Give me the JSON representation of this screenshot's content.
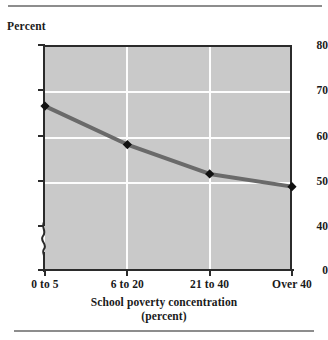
{
  "figure": {
    "y_axis_title": "Percent",
    "x_axis_title_line1": "School poverty concentration",
    "x_axis_title_line2": "(percent)"
  },
  "style": {
    "plot_fill": "#c9c9c9",
    "gridline_color": "#fdfdfd",
    "axis_color": "#2b2b2b",
    "line_color": "#6a6a6a",
    "marker_color": "#111111",
    "rule_color": "#8d8d8d"
  },
  "chart_data": {
    "type": "line",
    "title": "",
    "xlabel": "School poverty concentration (percent)",
    "ylabel": "Percent",
    "categories": [
      "0 to 5",
      "6 to 20",
      "21 to 40",
      "Over 40"
    ],
    "values": [
      66.5,
      58.0,
      51.5,
      48.7
    ],
    "ylim": [
      40,
      80
    ],
    "yticks": [
      80,
      70,
      60,
      50,
      40,
      0
    ],
    "ytick_labels": [
      "80",
      "70",
      "60",
      "50",
      "40",
      "0"
    ],
    "axis_break": true,
    "axis_break_between": [
      0,
      40
    ],
    "grid": true,
    "grid_horizontal": true,
    "grid_vertical": true,
    "legend": false,
    "marker": "diamond"
  }
}
